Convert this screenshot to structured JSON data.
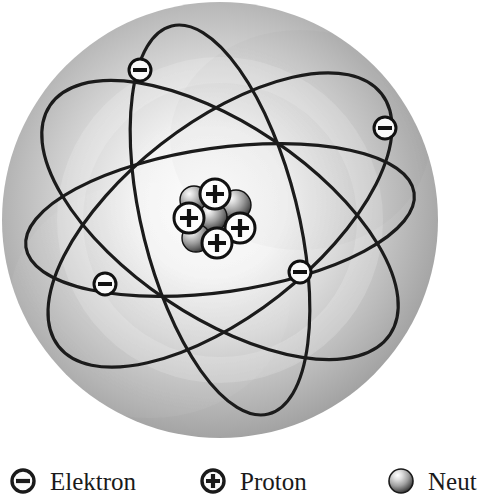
{
  "figure": {
    "shell": {
      "name": "electron-cloud-sphere",
      "cx": 220,
      "cy": 220,
      "r": 218,
      "edge_color": "#8e8e8e",
      "center_color": "#fbfbfb"
    },
    "orbits": [
      {
        "name": "orbit-1",
        "rx": 205,
        "ry": 96,
        "rotation": -38
      },
      {
        "name": "orbit-2",
        "rx": 205,
        "ry": 96,
        "rotation": 34
      },
      {
        "name": "orbit-3",
        "rx": 200,
        "ry": 78,
        "rotation": 76
      },
      {
        "name": "orbit-4",
        "rx": 196,
        "ry": 72,
        "rotation": -8
      }
    ],
    "orbit_color": "#1b1b1b",
    "electrons": [
      {
        "name": "electron-top-left",
        "cx": 140,
        "cy": 70,
        "r": 11,
        "symbol": "−"
      },
      {
        "name": "electron-right",
        "cx": 385,
        "cy": 128,
        "r": 11,
        "symbol": "−"
      },
      {
        "name": "electron-bottom-left",
        "cx": 105,
        "cy": 284,
        "r": 11,
        "symbol": "−"
      },
      {
        "name": "electron-bottom-right",
        "cx": 300,
        "cy": 272,
        "r": 11,
        "symbol": "−"
      }
    ],
    "nucleus": {
      "name": "nucleus",
      "cx": 215,
      "cy": 220,
      "protons": [
        {
          "name": "proton-top",
          "cx": 215,
          "cy": 194,
          "r": 15,
          "symbol": "+"
        },
        {
          "name": "proton-left",
          "cx": 189,
          "cy": 218,
          "r": 15,
          "symbol": "+"
        },
        {
          "name": "proton-right",
          "cx": 240,
          "cy": 228,
          "r": 15,
          "symbol": "+"
        },
        {
          "name": "proton-bottom",
          "cx": 217,
          "cy": 243,
          "r": 15,
          "symbol": "+"
        }
      ],
      "neutrons": [
        {
          "name": "neutron-upper-left",
          "cx": 194,
          "cy": 200,
          "r": 14
        },
        {
          "name": "neutron-upper-right",
          "cx": 236,
          "cy": 205,
          "r": 15
        },
        {
          "name": "neutron-center",
          "cx": 213,
          "cy": 217,
          "r": 14
        },
        {
          "name": "neutron-lower-left",
          "cx": 196,
          "cy": 238,
          "r": 14
        }
      ]
    }
  },
  "legend": {
    "items": [
      {
        "icon": "electron-icon",
        "label": "Elektron",
        "symbol": "−"
      },
      {
        "icon": "proton-icon",
        "label": "Proton",
        "symbol": "+"
      },
      {
        "icon": "neutron-icon",
        "label": "Neut",
        "symbol": ""
      }
    ]
  }
}
